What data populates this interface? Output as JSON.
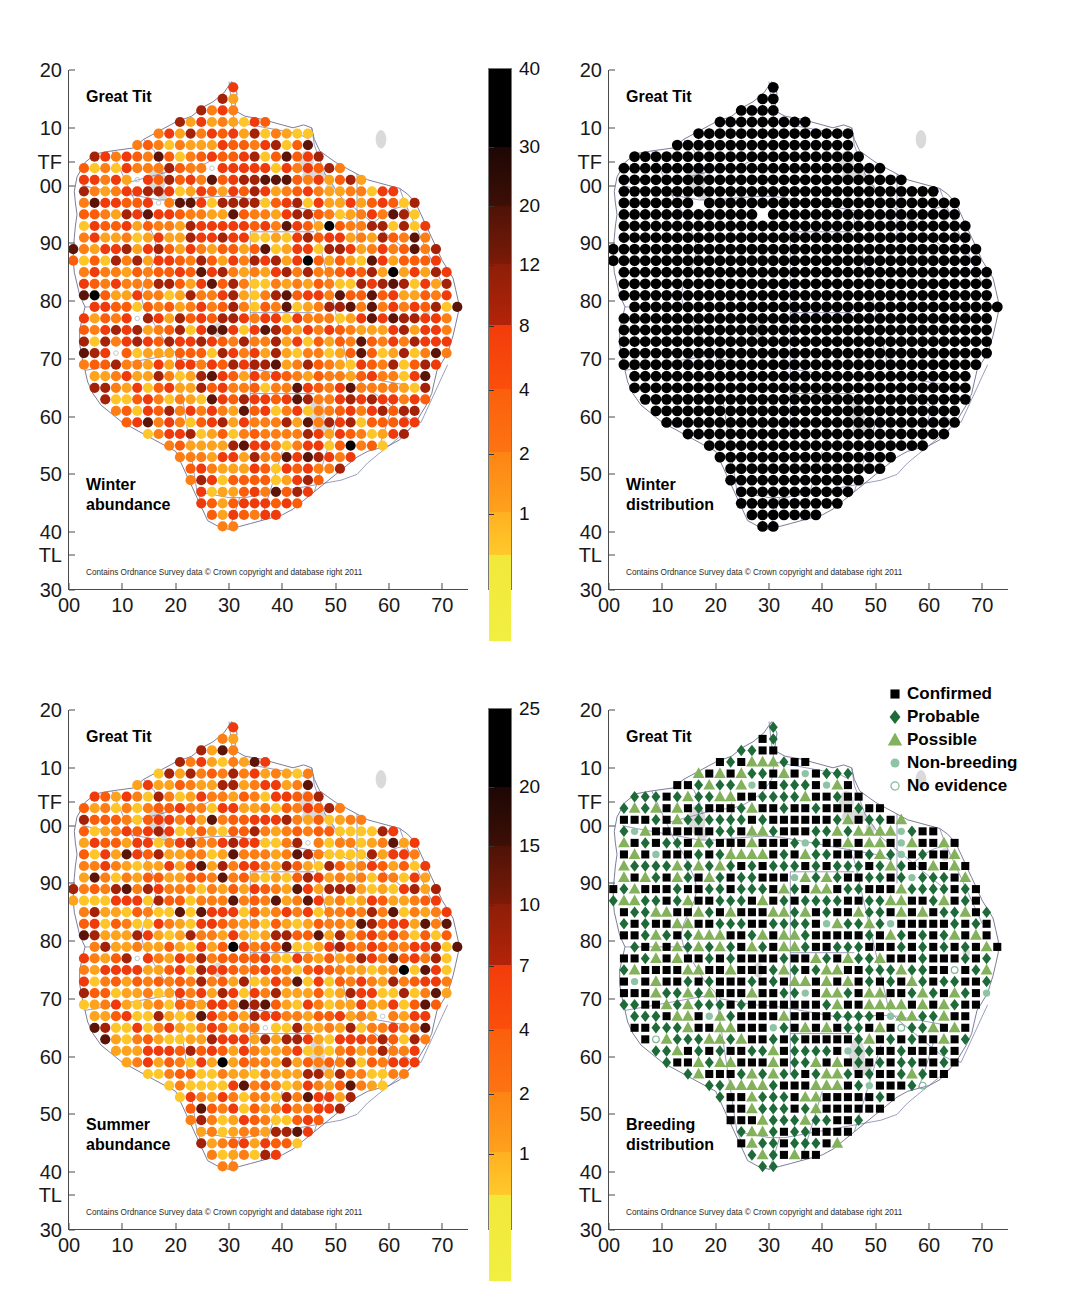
{
  "figure": {
    "attribution": "Contains Ordnance Survey data © Crown copyright and database right 2011",
    "species": "Great Tit"
  },
  "axes": {
    "y_ticks": [
      "20",
      "10",
      "TF",
      "00",
      "90",
      "80",
      "70",
      "60",
      "50",
      "40",
      "TL",
      "30"
    ],
    "x_ticks": [
      "00",
      "10",
      "20",
      "30",
      "40",
      "50",
      "60",
      "70"
    ]
  },
  "panels": [
    {
      "id": "winter-abundance",
      "title": "Great Tit",
      "caption_line1": "Winter",
      "caption_line2": "abundance",
      "kind": "abundance"
    },
    {
      "id": "winter-distribution",
      "title": "Great Tit",
      "caption_line1": "Winter",
      "caption_line2": "distribution",
      "kind": "presence"
    },
    {
      "id": "summer-abundance",
      "title": "Great Tit",
      "caption_line1": "Summer",
      "caption_line2": "abundance",
      "kind": "abundance"
    },
    {
      "id": "breeding-distribution",
      "title": "Great Tit",
      "caption_line1": "Breeding",
      "caption_line2": "distribution",
      "kind": "breeding"
    }
  ],
  "colorbars": [
    {
      "id": "winter-abundance-colorbar",
      "labels": [
        "40",
        "30",
        "20",
        "12",
        "8",
        "4",
        "2",
        "1"
      ],
      "colors": [
        "#000000",
        "#2b0a05",
        "#5c1408",
        "#a32208",
        "#ef3b0c",
        "#fb5e0a",
        "#fd7e14",
        "#fda31e",
        "#ffc629",
        "#f2ea3a"
      ]
    },
    {
      "id": "summer-abundance-colorbar",
      "labels": [
        "25",
        "20",
        "15",
        "10",
        "7",
        "4",
        "2",
        "1"
      ],
      "colors": [
        "#000000",
        "#2b0a05",
        "#5c1408",
        "#a32208",
        "#ef3b0c",
        "#fb5e0a",
        "#fd7e14",
        "#fda31e",
        "#ffc629",
        "#f2ea3a"
      ]
    }
  ],
  "breeding_legend": {
    "id": "breeding-legend",
    "items": [
      {
        "label": "Confirmed",
        "symbol": "square",
        "color": "#000000",
        "icon": "filled-square-icon"
      },
      {
        "label": "Probable",
        "symbol": "diamond",
        "color": "#1e6b39",
        "icon": "filled-diamond-icon"
      },
      {
        "label": "Possible",
        "symbol": "triangle",
        "color": "#84b15c",
        "icon": "filled-triangle-icon"
      },
      {
        "label": "Non-breeding",
        "symbol": "circle",
        "color": "#8fc3a5",
        "icon": "filled-circle-icon"
      },
      {
        "label": "No evidence",
        "symbol": "open-circle",
        "color": "#7fb892",
        "icon": "open-circle-icon"
      }
    ]
  },
  "chart_data": {
    "type": "scatter",
    "xlabel": "Ordnance Survey easting (10 km squares)",
    "ylabel": "Ordnance Survey northing (10 km squares)",
    "xlim": [
      0,
      75
    ],
    "ylim": [
      30,
      120
    ],
    "grid": false,
    "legend_position": "top-right (breeding panel only)",
    "panels": [
      {
        "name": "Winter abundance",
        "encoding": "colour = birds per tetrad, scale 1→2→4→8→12→20→30→40",
        "scale_breaks": [
          1,
          2,
          4,
          8,
          12,
          20,
          30,
          40
        ],
        "note": "filled dots on 2 km grid across Norfolk/Suffolk; open small circles = surveyed, none recorded"
      },
      {
        "name": "Winter distribution",
        "encoding": "black filled dot = present in winter",
        "note": "near-complete coverage of the region"
      },
      {
        "name": "Summer abundance",
        "encoding": "colour = birds per tetrad, scale 1→2→4→7→10→15→20→25",
        "scale_breaks": [
          1,
          2,
          4,
          7,
          10,
          15,
          20,
          25
        ],
        "note": "filled dots on 2 km grid; open small circles = surveyed, none recorded"
      },
      {
        "name": "Breeding distribution",
        "encoding": "symbol = breeding evidence category",
        "categories": [
          "Confirmed",
          "Probable",
          "Possible",
          "Non-breeding",
          "No evidence"
        ],
        "note": "black square = confirmed, dark green diamond = probable, light green triangle = possible"
      }
    ]
  }
}
